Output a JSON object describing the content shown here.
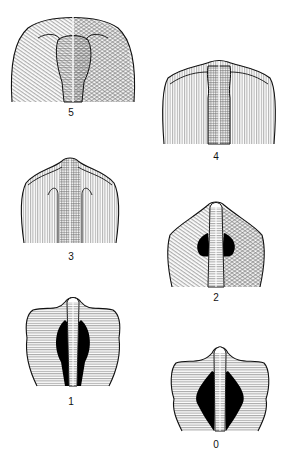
{
  "figure": {
    "panels": [
      {
        "grade": "5",
        "label": "5"
      },
      {
        "grade": "4",
        "label": "4"
      },
      {
        "grade": "3",
        "label": "3"
      },
      {
        "grade": "2",
        "label": "2"
      },
      {
        "grade": "1",
        "label": "1"
      },
      {
        "grade": "0",
        "label": "0"
      }
    ]
  },
  "colors": {
    "line": "#111111",
    "hatch": "#8a8a8a",
    "gap": "#000000",
    "background": "#ffffff"
  }
}
